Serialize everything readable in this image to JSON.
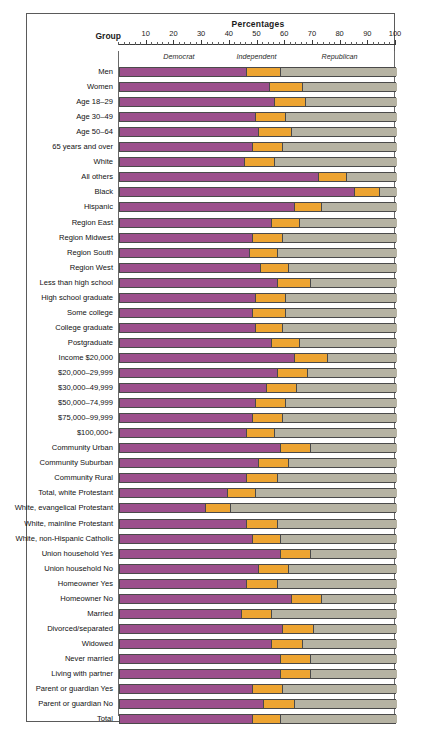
{
  "chart_data": {
    "type": "bar",
    "subtype": "stacked-horizontal-100",
    "title": "Percentages",
    "group_header": "Group",
    "xlabel": "Percentages",
    "ylabel": "Group",
    "xlim": [
      0,
      100
    ],
    "xticks": [
      10,
      20,
      30,
      40,
      50,
      60,
      70,
      80,
      90,
      100
    ],
    "xtick_labels": [
      "10",
      "20",
      "30",
      "40",
      "50",
      "60",
      "70",
      "80",
      "90",
      "100"
    ],
    "minor_tick_step": 2,
    "grid": false,
    "legend_position": "top-inline",
    "series": [
      {
        "name": "Democrat",
        "color": "#9C4F8C"
      },
      {
        "name": "Independent",
        "color": "#EDA431"
      },
      {
        "name": "Republican",
        "color": "#B6B3A3"
      }
    ],
    "legend_label_positions": [
      22,
      50,
      80
    ],
    "categories": [
      "Men",
      "Women",
      "Age 18–29",
      "Age 30–49",
      "Age 50–64",
      "65 years and over",
      "White",
      "All others",
      "Black",
      "Hispanic",
      "Region East",
      "Region Midwest",
      "Region South",
      "Region West",
      "Less than high school",
      "High school graduate",
      "Some college",
      "College graduate",
      "Postgraduate",
      "Income $20,000",
      "$20,000–29,999",
      "$30,000–49,999",
      "$50,000–74,999",
      "$75,000–99,999",
      "$100,000+",
      "Community Urban",
      "Community Suburban",
      "Community Rural",
      "Total, white Protestant",
      "White, evangelical Protestant",
      "White, mainline Protestant",
      "White, non-Hispanic Catholic",
      "Union household Yes",
      "Union household No",
      "Homeowner Yes",
      "Homeowner No",
      "Married",
      "Divorced/separated",
      "Widowed",
      "Never married",
      "Living with partner",
      "Parent or guardian Yes",
      "Parent or guardian No",
      "Total"
    ],
    "values": [
      {
        "category": "Men",
        "Democrat": 46,
        "Independent": 12,
        "Republican": 42
      },
      {
        "category": "Women",
        "Democrat": 54,
        "Independent": 12,
        "Republican": 34
      },
      {
        "category": "Age 18–29",
        "Democrat": 56,
        "Independent": 11,
        "Republican": 33
      },
      {
        "category": "Age 30–49",
        "Democrat": 49,
        "Independent": 11,
        "Republican": 40
      },
      {
        "category": "Age 50–64",
        "Democrat": 50,
        "Independent": 12,
        "Republican": 38
      },
      {
        "category": "65 years and over",
        "Democrat": 48,
        "Independent": 11,
        "Republican": 41
      },
      {
        "category": "White",
        "Democrat": 45,
        "Independent": 11,
        "Republican": 44
      },
      {
        "category": "All others",
        "Democrat": 72,
        "Independent": 10,
        "Republican": 18
      },
      {
        "category": "Black",
        "Democrat": 85,
        "Independent": 9,
        "Republican": 6
      },
      {
        "category": "Hispanic",
        "Democrat": 63,
        "Independent": 10,
        "Republican": 27
      },
      {
        "category": "Region East",
        "Democrat": 55,
        "Independent": 10,
        "Republican": 35
      },
      {
        "category": "Region Midwest",
        "Democrat": 48,
        "Independent": 11,
        "Republican": 41
      },
      {
        "category": "Region South",
        "Democrat": 47,
        "Independent": 10,
        "Republican": 43
      },
      {
        "category": "Region West",
        "Democrat": 51,
        "Independent": 10,
        "Republican": 39
      },
      {
        "category": "Less than high school",
        "Democrat": 57,
        "Independent": 12,
        "Republican": 31
      },
      {
        "category": "High school graduate",
        "Democrat": 49,
        "Independent": 11,
        "Republican": 40
      },
      {
        "category": "Some college",
        "Democrat": 48,
        "Independent": 12,
        "Republican": 40
      },
      {
        "category": "College graduate",
        "Democrat": 49,
        "Independent": 10,
        "Republican": 41
      },
      {
        "category": "Postgraduate",
        "Democrat": 55,
        "Independent": 10,
        "Republican": 35
      },
      {
        "category": "Income $20,000",
        "Democrat": 63,
        "Independent": 12,
        "Republican": 25
      },
      {
        "category": "$20,000–29,999",
        "Democrat": 57,
        "Independent": 11,
        "Republican": 32
      },
      {
        "category": "$30,000–49,999",
        "Democrat": 53,
        "Independent": 11,
        "Republican": 36
      },
      {
        "category": "$50,000–74,999",
        "Democrat": 49,
        "Independent": 11,
        "Republican": 40
      },
      {
        "category": "$75,000–99,999",
        "Democrat": 48,
        "Independent": 11,
        "Republican": 41
      },
      {
        "category": "$100,000+",
        "Democrat": 46,
        "Independent": 10,
        "Republican": 44
      },
      {
        "category": "Community Urban",
        "Democrat": 58,
        "Independent": 11,
        "Republican": 31
      },
      {
        "category": "Community Suburban",
        "Democrat": 50,
        "Independent": 11,
        "Republican": 39
      },
      {
        "category": "Community Rural",
        "Democrat": 46,
        "Independent": 11,
        "Republican": 43
      },
      {
        "category": "Total, white Protestant",
        "Democrat": 39,
        "Independent": 10,
        "Republican": 51
      },
      {
        "category": "White, evangelical Protestant",
        "Democrat": 31,
        "Independent": 9,
        "Republican": 60
      },
      {
        "category": "White, mainline Protestant",
        "Democrat": 46,
        "Independent": 11,
        "Republican": 43
      },
      {
        "category": "White, non-Hispanic Catholic",
        "Democrat": 48,
        "Independent": 10,
        "Republican": 42
      },
      {
        "category": "Union household Yes",
        "Democrat": 58,
        "Independent": 11,
        "Republican": 31
      },
      {
        "category": "Union household No",
        "Democrat": 50,
        "Independent": 11,
        "Republican": 39
      },
      {
        "category": "Homeowner Yes",
        "Democrat": 46,
        "Independent": 11,
        "Republican": 43
      },
      {
        "category": "Homeowner No",
        "Democrat": 62,
        "Independent": 11,
        "Republican": 27
      },
      {
        "category": "Married",
        "Democrat": 44,
        "Independent": 11,
        "Republican": 45
      },
      {
        "category": "Divorced/separated",
        "Democrat": 59,
        "Independent": 11,
        "Republican": 30
      },
      {
        "category": "Widowed",
        "Democrat": 55,
        "Independent": 11,
        "Republican": 34
      },
      {
        "category": "Never married",
        "Democrat": 58,
        "Independent": 11,
        "Republican": 31
      },
      {
        "category": "Living with partner",
        "Democrat": 58,
        "Independent": 11,
        "Republican": 31
      },
      {
        "category": "Parent or guardian Yes",
        "Democrat": 48,
        "Independent": 11,
        "Republican": 41
      },
      {
        "category": "Parent or guardian No",
        "Democrat": 52,
        "Independent": 11,
        "Republican": 37
      },
      {
        "category": "Total",
        "Democrat": 48,
        "Independent": 10,
        "Republican": 42
      }
    ]
  }
}
